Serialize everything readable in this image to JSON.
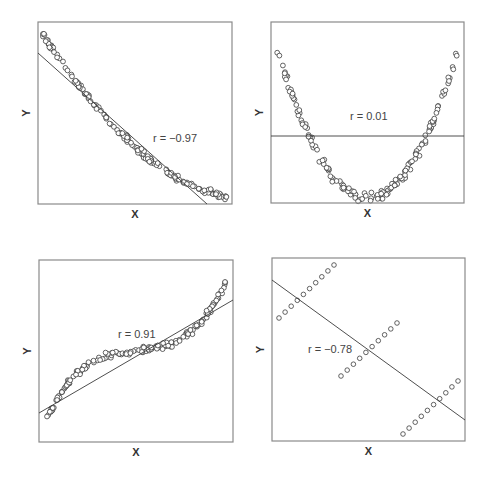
{
  "chart_data": [
    {
      "type": "scatter",
      "panel": "top-left",
      "title": "",
      "xlabel": "X",
      "ylabel": "Y",
      "annotation": "r = −0.97",
      "correlation": -0.97,
      "description": "Monotonic decreasing convex curve with linear fit line",
      "box": {
        "left": 38,
        "top": 22,
        "right": 232,
        "bottom": 204
      },
      "curve": {
        "kind": "convex-decreasing",
        "n": 160,
        "x_range": [
          0.02,
          0.98
        ],
        "noise": 0.012
      },
      "fit_line": {
        "x1": 38,
        "y1": 53,
        "x2": 207,
        "y2": 204
      },
      "label_pos": {
        "x": 153,
        "y": 142
      },
      "grid": false
    },
    {
      "type": "scatter",
      "panel": "top-right",
      "title": "",
      "xlabel": "X",
      "ylabel": "Y",
      "annotation": "r = 0.01",
      "correlation": 0.01,
      "description": "U-shaped parabola with horizontal linear fit line",
      "box": {
        "left": 271,
        "top": 22,
        "right": 464,
        "bottom": 203
      },
      "curve": {
        "kind": "parabola",
        "n": 160,
        "x_range": [
          0.03,
          0.97
        ],
        "noise": 0.018
      },
      "fit_line": {
        "x1": 271,
        "y1": 136,
        "x2": 464,
        "y2": 136
      },
      "label_pos": {
        "x": 350,
        "y": 120
      },
      "grid": false
    },
    {
      "type": "scatter",
      "panel": "bottom-left",
      "title": "",
      "xlabel": "X",
      "ylabel": "Y",
      "annotation": "r = 0.91",
      "correlation": 0.91,
      "description": "Cubic S-shaped curve with increasing linear fit line",
      "box": {
        "left": 39,
        "top": 260,
        "right": 233,
        "bottom": 442
      },
      "curve": {
        "kind": "cubic",
        "n": 170,
        "x_range": [
          0.04,
          0.96
        ],
        "noise": 0.012
      },
      "fit_line": {
        "x1": 39,
        "y1": 413,
        "x2": 233,
        "y2": 300
      },
      "label_pos": {
        "x": 118,
        "y": 338
      },
      "grid": false
    },
    {
      "type": "scatter",
      "panel": "bottom-right",
      "title": "",
      "xlabel": "X",
      "ylabel": "Y",
      "annotation": "r = −0.78",
      "correlation": -0.78,
      "description": "Three parallel positively-sloped clusters of 10 points each with overall negative linear fit",
      "box": {
        "left": 272,
        "top": 258,
        "right": 465,
        "bottom": 441
      },
      "clusters": [
        {
          "x1": 279,
          "y1": 318,
          "x2": 334,
          "y2": 265,
          "n": 10
        },
        {
          "x1": 341,
          "y1": 376,
          "x2": 397,
          "y2": 323,
          "n": 10
        },
        {
          "x1": 403,
          "y1": 434,
          "x2": 458,
          "y2": 381,
          "n": 10
        }
      ],
      "fit_line": {
        "x1": 272,
        "y1": 280,
        "x2": 465,
        "y2": 420
      },
      "label_pos": {
        "x": 308,
        "y": 353
      },
      "grid": false
    }
  ]
}
